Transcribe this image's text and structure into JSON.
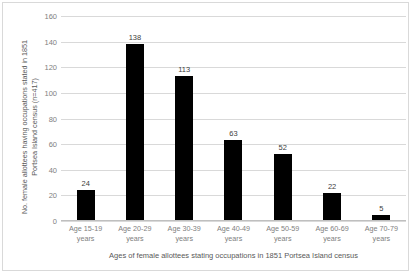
{
  "chart_data": {
    "type": "bar",
    "title": "",
    "categories": [
      "Age 15-19 years",
      "Age 20-29 years",
      "Age 30-39 years",
      "Age 40-49 years",
      "Age 50-59 years",
      "Age 60-69 years",
      "Age 70-79 years"
    ],
    "category_lines": [
      [
        "Age 15-19",
        "years"
      ],
      [
        "Age 20-29",
        "years"
      ],
      [
        "Age 30-39",
        "years"
      ],
      [
        "Age 40-49",
        "years"
      ],
      [
        "Age 50-59",
        "years"
      ],
      [
        "Age 60-69",
        "years"
      ],
      [
        "Age 70-79",
        "years"
      ]
    ],
    "values": [
      24,
      138,
      113,
      63,
      52,
      22,
      5
    ],
    "data_labels": [
      "24",
      "138",
      "113",
      "63",
      "52",
      "22",
      "5"
    ],
    "xlabel": "Ages of female allottees stating occupations in 1851 Portsea Island census",
    "ylabel": "No. female allottees having occupations stated in 1851 Portsea Island census (n=417)",
    "ylabel_lines": [
      "No. female allottees having occupations stated in 1851",
      "Portsea Island census (n=417)"
    ],
    "ylim": [
      0,
      160
    ],
    "yticks": [
      0,
      20,
      40,
      60,
      80,
      100,
      120,
      140,
      160
    ],
    "ytick_labels": [
      "0",
      "20",
      "40",
      "60",
      "80",
      "100",
      "120",
      "140",
      "160"
    ],
    "grid": true,
    "legend": false,
    "bar_color": "#000000",
    "gridline_color": "#D9D9D9",
    "axis_color": "#BFBFBF",
    "label_color": "#808080",
    "title_color": "#595959"
  }
}
